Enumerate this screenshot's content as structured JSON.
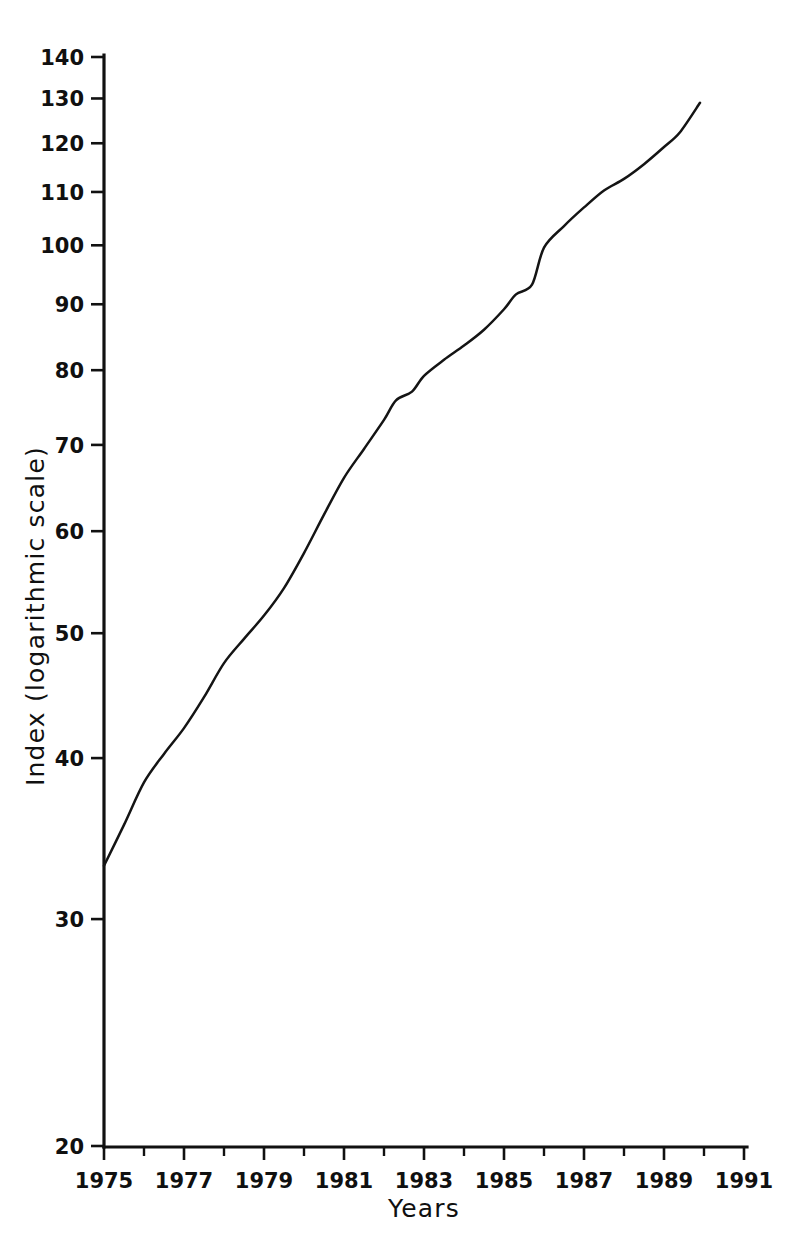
{
  "chart_data": {
    "type": "line",
    "title": "",
    "xlabel": "Years",
    "ylabel": "Index (logarithmic scale)",
    "yscale": "log",
    "ylim": [
      20,
      140
    ],
    "xlim": [
      1975,
      1991
    ],
    "grid": false,
    "legend": null,
    "y_ticks": [
      20,
      30,
      40,
      50,
      60,
      70,
      80,
      90,
      100,
      110,
      120,
      130,
      140
    ],
    "y_tick_labels": [
      "20",
      "30",
      "40",
      "50",
      "60",
      "70",
      "80",
      "90",
      "100",
      "110",
      "120",
      "130",
      "140"
    ],
    "x_ticks": [
      1975,
      1977,
      1979,
      1981,
      1983,
      1985,
      1987,
      1989,
      1991
    ],
    "x_tick_labels": [
      "1975",
      "1977",
      "1979",
      "1981",
      "1983",
      "1985",
      "1987",
      "1989",
      "1991"
    ],
    "x_minor_ticks": [
      1976,
      1978,
      1980,
      1982,
      1984,
      1986,
      1988,
      1990
    ],
    "series": [
      {
        "name": "Index",
        "x": [
          1975.0,
          1975.5,
          1976.0,
          1976.5,
          1977.0,
          1977.5,
          1978.0,
          1978.5,
          1979.0,
          1979.5,
          1980.0,
          1980.5,
          1981.0,
          1981.5,
          1982.0,
          1982.3,
          1982.7,
          1983.0,
          1983.5,
          1984.0,
          1984.5,
          1985.0,
          1985.3,
          1985.7,
          1986.0,
          1986.5,
          1987.0,
          1987.5,
          1988.0,
          1988.5,
          1989.0,
          1989.4,
          1989.9
        ],
        "values": [
          33.0,
          35.5,
          38.3,
          40.3,
          42.2,
          44.6,
          47.4,
          49.5,
          51.6,
          54.2,
          57.7,
          61.8,
          66.0,
          69.5,
          73.2,
          75.8,
          77.0,
          79.2,
          81.5,
          83.6,
          86.0,
          89.2,
          91.6,
          93.2,
          99.6,
          103.5,
          107.0,
          110.3,
          112.6,
          115.6,
          119.2,
          122.4,
          129.0
        ]
      }
    ]
  },
  "axes": {
    "y_axis_name": "y-axis",
    "x_axis_name": "x-axis"
  }
}
